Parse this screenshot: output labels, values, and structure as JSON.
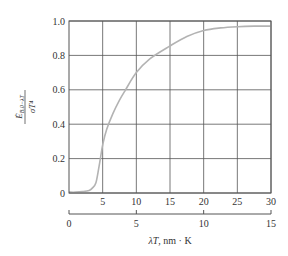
{
  "chart_data": {
    "type": "line",
    "title": "",
    "xlabel": "λT, nm · K",
    "ylabel": "Ė_{B,0−λT} / σT⁴",
    "ylabel_num": "Ė",
    "ylabel_sub": "B,0−λT",
    "ylabel_den": "σT⁴",
    "xlim": [
      0,
      30
    ],
    "ylim": [
      0,
      1.0
    ],
    "grid": true,
    "x_ticks": [
      "5",
      "10",
      "15",
      "20",
      "25",
      "30"
    ],
    "x_tick_values": [
      5,
      10,
      15,
      20,
      25,
      30
    ],
    "y_ticks": [
      "0",
      "0.2",
      "0.4",
      "0.6",
      "0.8",
      "1.0"
    ],
    "y_tick_values": [
      0,
      0.2,
      0.4,
      0.6,
      0.8,
      1.0
    ],
    "secondary_x_axis": {
      "ticks": [
        "0",
        "5",
        "10",
        "15"
      ],
      "tick_values": [
        0,
        5,
        10,
        15
      ],
      "range": [
        0,
        15
      ]
    },
    "series": [
      {
        "name": "blackbody fraction",
        "color": "#b3b3b3",
        "x": [
          0,
          1,
          2,
          3,
          3.5,
          4,
          4.4,
          4.7,
          5,
          5.6,
          6.5,
          7.5,
          8.4,
          10,
          12,
          15,
          17.5,
          20,
          22.5,
          25,
          27.5,
          30
        ],
        "y": [
          0.005,
          0.005,
          0.008,
          0.015,
          0.03,
          0.06,
          0.14,
          0.21,
          0.28,
          0.37,
          0.46,
          0.54,
          0.6,
          0.7,
          0.78,
          0.855,
          0.91,
          0.945,
          0.96,
          0.967,
          0.97,
          0.97
        ]
      }
    ]
  }
}
